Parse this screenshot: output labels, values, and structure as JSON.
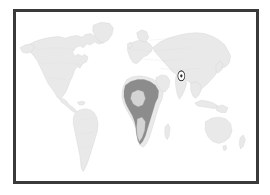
{
  "figure": {
    "kind": "distribution-range-map",
    "title": "World distribution map",
    "caption": "",
    "width": 270,
    "height": 195,
    "background_color": "#ffffff"
  },
  "frame": {
    "border_color": "#3a3a3a",
    "border_width_px": 3,
    "left": 13,
    "top": 9,
    "width": 246,
    "height": 175,
    "fill_color": "#ffffff"
  },
  "map": {
    "projection": "equirectangular",
    "lon_range": [
      -180,
      180
    ],
    "lat_range": [
      -90,
      90
    ],
    "ocean_color": "#ffffff",
    "land_color": "#e9e9e9",
    "land_outline_color": "#cfcfcf",
    "internal_border_color": "#dcdcdc",
    "graticule_visible": false,
    "labels_visible": false,
    "landmasses": [
      "North America",
      "Greenland",
      "South America",
      "Europe",
      "Africa",
      "Asia",
      "Australia",
      "Madagascar",
      "Indonesia",
      "Japan",
      "British Isles",
      "New Zealand"
    ]
  },
  "range_overlay": {
    "label": "Distribution range",
    "region": "Sub-Saharan Africa",
    "fill_color": "#8c8c8c",
    "hole_label": "Congo Basin gap",
    "hole_color": "#d4d4d4",
    "approx_extent": {
      "lon_min": -17,
      "lon_max": 51,
      "lat_min": -35,
      "lat_max": 17
    }
  },
  "marker": {
    "name": "target-marker",
    "symbol": "ring-and-dot",
    "label": "",
    "color": "#2e2e2e",
    "center_px": [
      183,
      99
    ],
    "outer_radius_px": 4.6,
    "dot_radius_px": 1.5,
    "approx_lon": 68,
    "approx_lat": 22
  },
  "legend": {
    "visible": false,
    "entries": []
  },
  "scale_bar": {
    "visible": false,
    "text": ""
  }
}
